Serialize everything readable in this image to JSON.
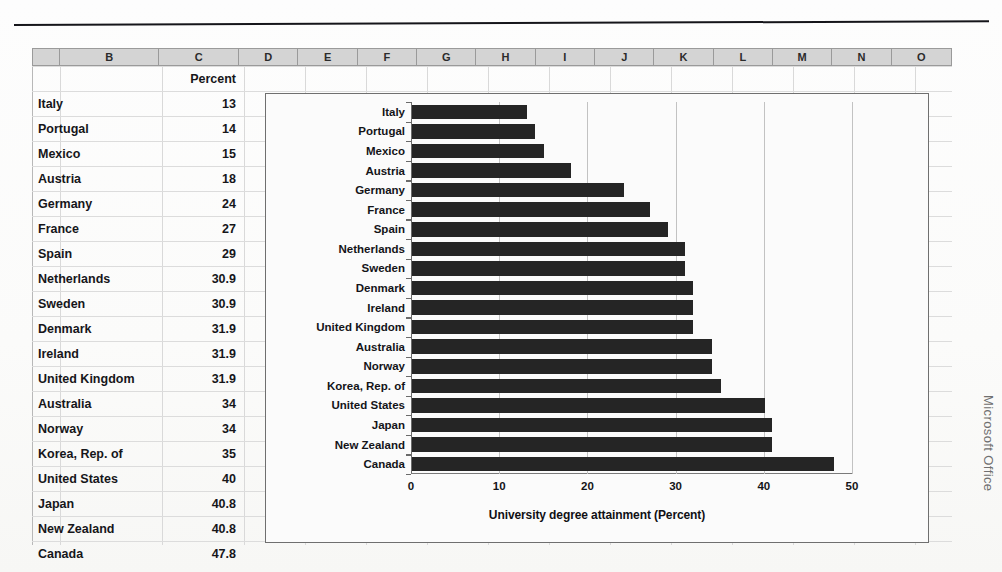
{
  "sheet": {
    "columns": [
      "B",
      "C",
      "D",
      "E",
      "F",
      "G",
      "H",
      "I",
      "J",
      "K",
      "L",
      "M",
      "N",
      "O"
    ],
    "header_row": {
      "b": "",
      "c": "Percent"
    },
    "rows": [
      {
        "country": "Italy",
        "percent": "13"
      },
      {
        "country": "Portugal",
        "percent": "14"
      },
      {
        "country": "Mexico",
        "percent": "15"
      },
      {
        "country": "Austria",
        "percent": "18"
      },
      {
        "country": "Germany",
        "percent": "24"
      },
      {
        "country": "France",
        "percent": "27"
      },
      {
        "country": "Spain",
        "percent": "29"
      },
      {
        "country": "Netherlands",
        "percent": "30.9"
      },
      {
        "country": "Sweden",
        "percent": "30.9"
      },
      {
        "country": "Denmark",
        "percent": "31.9"
      },
      {
        "country": "Ireland",
        "percent": "31.9"
      },
      {
        "country": "United Kingdom",
        "percent": "31.9"
      },
      {
        "country": "Australia",
        "percent": "34"
      },
      {
        "country": "Norway",
        "percent": "34"
      },
      {
        "country": "Korea, Rep. of",
        "percent": "35"
      },
      {
        "country": "United States",
        "percent": "40"
      },
      {
        "country": "Japan",
        "percent": "40.8"
      },
      {
        "country": "New Zealand",
        "percent": "40.8"
      },
      {
        "country": "Canada",
        "percent": "47.8"
      }
    ]
  },
  "chart_data": {
    "type": "bar",
    "orientation": "horizontal",
    "title": "",
    "xlabel": "University degree attainment (Percent)",
    "ylabel": "",
    "xlim": [
      0,
      50
    ],
    "xticks": [
      "0",
      "10",
      "20",
      "30",
      "40",
      "50"
    ],
    "grid": true,
    "legend": false,
    "bar_color": "#252525",
    "categories": [
      "Italy",
      "Portugal",
      "Mexico",
      "Austria",
      "Germany",
      "France",
      "Spain",
      "Netherlands",
      "Sweden",
      "Denmark",
      "Ireland",
      "United Kingdom",
      "Australia",
      "Norway",
      "Korea, Rep. of",
      "United States",
      "Japan",
      "New Zealand",
      "Canada"
    ],
    "values": [
      13,
      14,
      15,
      18,
      24,
      27,
      29,
      30.9,
      30.9,
      31.9,
      31.9,
      31.9,
      34,
      34,
      35,
      40,
      40.8,
      40.8,
      47.8
    ]
  },
  "credit": "Microsoft Office"
}
